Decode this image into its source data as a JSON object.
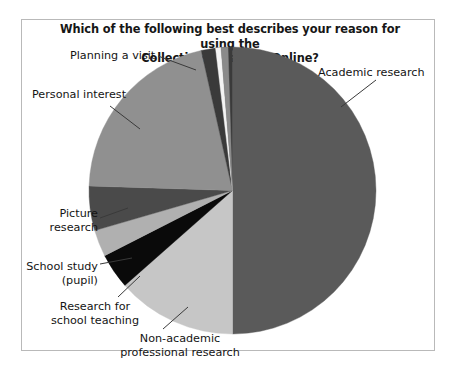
{
  "chart": {
    "title_line1": "Which of the following best describes your reason for using the",
    "title_line2": "Collection Database Online?"
  },
  "chart_data": {
    "type": "pie",
    "title": "Which of the following best describes your reason for using the Collection Database Online?",
    "xlabel": "",
    "ylabel": "",
    "legend": "none (direct labels with leader lines)",
    "grid": false,
    "start_angle_deg": 0,
    "direction": "clockwise",
    "categories": [
      "Academic research",
      "Non-academic professional research",
      "Research for school teaching",
      "School study (pupil)",
      "Picture research",
      "Personal interest",
      "Planning a visit"
    ],
    "values": [
      50,
      13.5,
      4,
      3,
      5,
      21,
      3.5
    ],
    "units": "percent",
    "colors": [
      "#5a5a5a",
      "#c6c6c6",
      "#0a0a0a",
      "#b0b0b0",
      "#4a4a4a",
      "#909090",
      "#3a3a3a"
    ],
    "slices": [
      {
        "label": "Academic research",
        "value": 50,
        "color": "#5a5a5a",
        "start_deg": 0,
        "end_deg": 180
      },
      {
        "label": "Non-academic professional research",
        "value": 13.5,
        "color": "#c6c6c6",
        "start_deg": 180,
        "end_deg": 228.6
      },
      {
        "label": "Research for school teaching",
        "value": 4,
        "color": "#0a0a0a",
        "start_deg": 228.6,
        "end_deg": 243
      },
      {
        "label": "School study (pupil)",
        "value": 3,
        "color": "#b0b0b0",
        "start_deg": 243,
        "end_deg": 253.8
      },
      {
        "label": "Picture research",
        "value": 5,
        "color": "#4a4a4a",
        "start_deg": 253.8,
        "end_deg": 271.8
      },
      {
        "label": "Personal interest",
        "value": 21,
        "color": "#909090",
        "start_deg": 271.8,
        "end_deg": 347.4
      },
      {
        "label": "Planning a visit",
        "value": 3.5,
        "color": "#3a3a3a",
        "start_deg": 347.4,
        "end_deg": 360
      }
    ],
    "extra_slivers": [
      {
        "label": "sliver-white",
        "color": "#f4f4f4",
        "start_deg": 353.2,
        "end_deg": 355.4
      },
      {
        "label": "sliver-gray",
        "color": "#8a8a8a",
        "start_deg": 355.4,
        "end_deg": 358.2
      }
    ]
  },
  "labels": {
    "academic_research": "Academic research",
    "planning_a_visit": "Planning a visit",
    "personal_interest": "Personal interest",
    "picture_research_l1": "Picture",
    "picture_research_l2": "research",
    "school_study_l1": "School study",
    "school_study_l2": "(pupil)",
    "research_teaching_l1": "Research for",
    "research_teaching_l2": "school teaching",
    "non_academic_l1": "Non-academic",
    "non_academic_l2": "professional research"
  }
}
